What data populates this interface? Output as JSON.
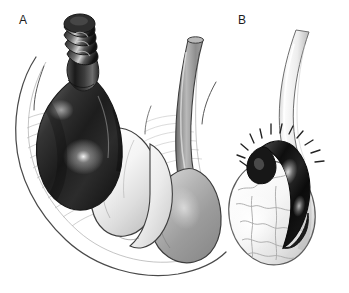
{
  "figure": {
    "background_color": "#ffffff",
    "width": 349,
    "height": 293,
    "style": "grayscale medical line-and-wash illustration",
    "panels": [
      {
        "id": "A",
        "label": "A",
        "label_x": 19,
        "label_y": 24,
        "caption": "Testicular torsion: spermatic cord twisted, dark congested testis within opened tunica vaginalis",
        "structures": [
          {
            "name": "twisted-spermatic-cord",
            "description": "spermatic cord with multiple spiral twists",
            "tone": "dark",
            "fill": "#2a2a2a"
          },
          {
            "name": "torsed-testis",
            "description": "ischemic congested testis, dark with specular highlight",
            "tone": "dark",
            "fill": "#262626"
          },
          {
            "name": "tunica-vaginalis-layers",
            "description": "concentric layered fascial sheets opened to the left",
            "tone": "very-light",
            "fill": "#fafafa"
          },
          {
            "name": "epididymis-lobe",
            "description": "pale lobed epididymis displaced anteriorly",
            "tone": "light",
            "fill": "#f2f2f2"
          },
          {
            "name": "contralateral-cord",
            "description": "untwisted gray spermatic cord on the right",
            "tone": "mid-gray",
            "fill": "#8c8c8c"
          },
          {
            "name": "contralateral-testis",
            "description": "normal gray testis at lower right",
            "tone": "mid-gray",
            "fill": "#a8a8a8"
          }
        ]
      },
      {
        "id": "B",
        "label": "B",
        "label_x": 238,
        "label_y": 24,
        "caption": "Torsion of the appendix testis: pale testis with dark infarcted appendix at the upper pole and radiating pain lines",
        "structures": [
          {
            "name": "normal-spermatic-cord",
            "description": "pale untwisted spermatic cord curving from upper right",
            "tone": "very-light",
            "fill": "#f7f7f7"
          },
          {
            "name": "torsed-appendix-testis",
            "description": "dark necrotic appendix testis (blue dot sign) draped over the superior pole",
            "tone": "dark",
            "fill": "#1e1e1e"
          },
          {
            "name": "testis-body",
            "description": "pale ovoid testis with fine surface vascular markings",
            "tone": "very-light",
            "fill": "#f4f4f4"
          },
          {
            "name": "pain-radiating-lines",
            "description": "short radiating tick marks denoting focal tenderness",
            "count": 12,
            "tone": "dark",
            "stroke": "#222222"
          }
        ]
      }
    ],
    "palette": {
      "ink": "#1c1c1c",
      "outline": "#3a3a3a",
      "dark_tissue": "#242424",
      "mid_tissue": "#9a9a9a",
      "light_tissue": "#f2f2f2",
      "highlight": "#ffffff",
      "background": "#ffffff"
    }
  }
}
